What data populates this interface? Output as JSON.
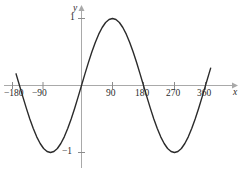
{
  "chart_data": {
    "type": "line",
    "title": "",
    "subtitle": "",
    "xlabel": "x",
    "ylabel": "y",
    "function": "y = sin(x)",
    "x_unit": "degrees",
    "xlim": [
      -195,
      378
    ],
    "ylim": [
      -1.45,
      1.35
    ],
    "grid": false,
    "legend": null,
    "x_ticks": [
      -180,
      -90,
      90,
      180,
      270,
      360
    ],
    "x_tick_labels": [
      "−180",
      "−90",
      "90",
      "180",
      "270",
      "360"
    ],
    "y_ticks": [
      1,
      -1
    ],
    "y_tick_labels": [
      "1",
      "−1"
    ],
    "series": [
      {
        "name": "sin",
        "color": "#2b2b2b",
        "x": [
          -190,
          -180,
          -170,
          -160,
          -150,
          -140,
          -130,
          -120,
          -110,
          -100,
          -90,
          -80,
          -70,
          -60,
          -50,
          -40,
          -30,
          -20,
          -10,
          0,
          10,
          20,
          30,
          40,
          50,
          60,
          70,
          80,
          90,
          100,
          110,
          120,
          130,
          140,
          150,
          160,
          170,
          180,
          190,
          200,
          210,
          220,
          230,
          240,
          250,
          260,
          270,
          280,
          290,
          300,
          310,
          320,
          330,
          340,
          350,
          360,
          370,
          375
        ],
        "y": [
          0.174,
          0.0,
          -0.174,
          -0.342,
          -0.5,
          -0.643,
          -0.766,
          -0.866,
          -0.94,
          -0.985,
          -1.0,
          -0.985,
          -0.94,
          -0.866,
          -0.766,
          -0.643,
          -0.5,
          -0.342,
          -0.174,
          0.0,
          0.174,
          0.342,
          0.5,
          0.643,
          0.766,
          0.866,
          0.94,
          0.985,
          1.0,
          0.985,
          0.94,
          0.866,
          0.766,
          0.643,
          0.5,
          0.342,
          0.174,
          0.0,
          -0.174,
          -0.342,
          -0.5,
          -0.643,
          -0.766,
          -0.866,
          -0.94,
          -0.985,
          -1.0,
          -0.985,
          -0.94,
          -0.866,
          -0.766,
          -0.643,
          -0.5,
          -0.342,
          -0.174,
          0.0,
          0.174,
          0.259
        ]
      }
    ],
    "key_points": {
      "maxima": [
        {
          "x": 90,
          "y": 1
        }
      ],
      "minima": [
        {
          "x": -90,
          "y": -1
        },
        {
          "x": 270,
          "y": -1
        }
      ],
      "zeros": [
        -180,
        0,
        180,
        360
      ]
    },
    "colors": {
      "curve": "#2b2b2b",
      "axis": "#a9a9a9",
      "tick": "#8c8c8c",
      "text": "#2b2b2b",
      "background": "#ffffff"
    }
  },
  "axes": {
    "x_axis_label": "x",
    "y_axis_label": "y"
  }
}
